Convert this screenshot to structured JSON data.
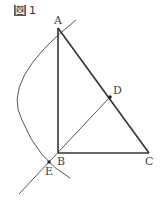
{
  "figure": {
    "title_mark": "図",
    "title_number": "1",
    "points": {
      "A": {
        "label": "A",
        "x": 58,
        "y": 28
      },
      "B": {
        "label": "B",
        "x": 58,
        "y": 153
      },
      "C": {
        "label": "C",
        "x": 149,
        "y": 153
      },
      "D": {
        "label": "D",
        "x": 110,
        "y": 97
      },
      "E": {
        "label": "E",
        "x": 49,
        "y": 162
      }
    },
    "colors": {
      "stroke": "#333333",
      "thin": "#444444"
    }
  }
}
